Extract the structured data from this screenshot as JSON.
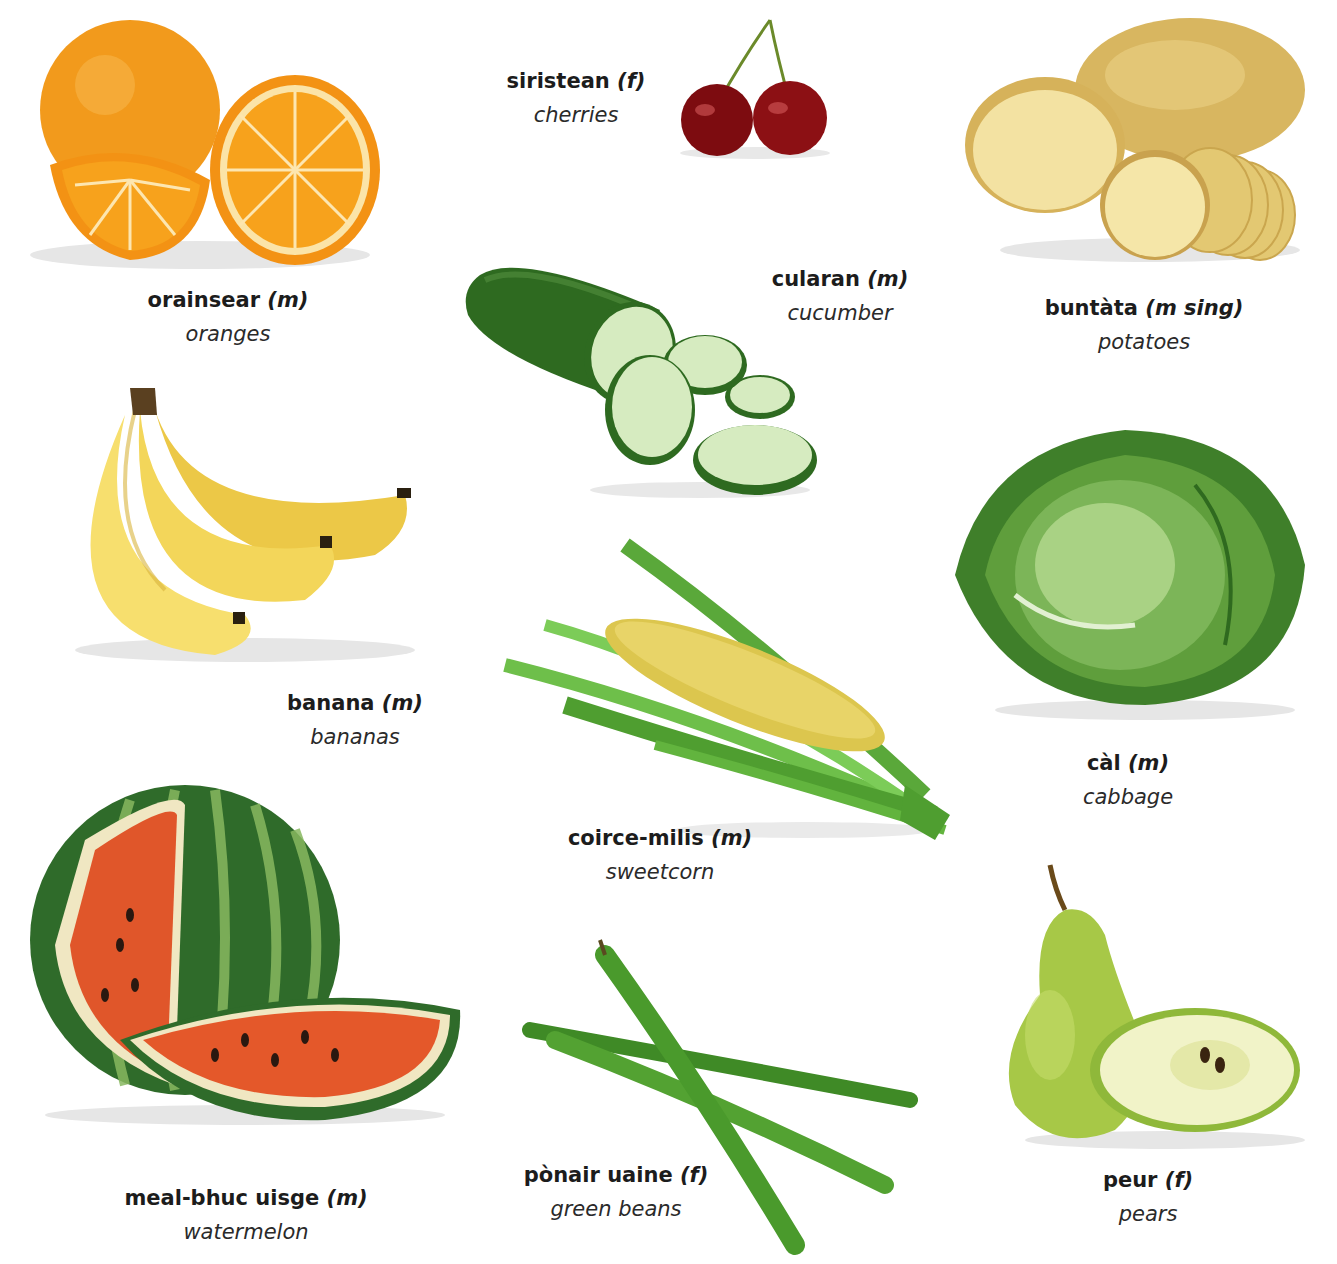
{
  "page": {
    "background": "#ffffff",
    "items": [
      {
        "id": "oranges",
        "gaelic": "orainsear",
        "gender": "(m)",
        "english": "oranges",
        "color": "#f39a1e"
      },
      {
        "id": "cherries",
        "gaelic": "siristean",
        "gender": "(f)",
        "english": "cherries",
        "color": "#8b0f12"
      },
      {
        "id": "potatoes",
        "gaelic": "buntàta",
        "gender": "(m sing)",
        "english": "potatoes",
        "color": "#e6c878"
      },
      {
        "id": "cucumber",
        "gaelic": "cularan",
        "gender": "(m)",
        "english": "cucumber",
        "color": "#2f6b22"
      },
      {
        "id": "bananas",
        "gaelic": "banana",
        "gender": "(m)",
        "english": "bananas",
        "color": "#f3d45a"
      },
      {
        "id": "cabbage",
        "gaelic": "càl",
        "gender": "(m)",
        "english": "cabbage",
        "color": "#5d9c3b"
      },
      {
        "id": "sweetcorn",
        "gaelic": "coirce-milis",
        "gender": "(m)",
        "english": "sweetcorn",
        "color": "#d9c24a"
      },
      {
        "id": "watermelon",
        "gaelic": "meal-bhuc uisge",
        "gender": "(m)",
        "english": "watermelon",
        "color": "#e0562a"
      },
      {
        "id": "green-beans",
        "gaelic": "pònair uaine",
        "gender": "(f)",
        "english": "green beans",
        "color": "#4f9a2f"
      },
      {
        "id": "pears",
        "gaelic": "peur",
        "gender": "(f)",
        "english": "pears",
        "color": "#a9c84a"
      }
    ]
  }
}
